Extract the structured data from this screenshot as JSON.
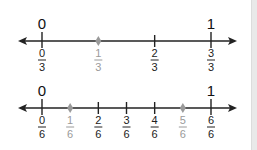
{
  "number_lines": [
    {
      "name": "thirds",
      "start_label": "0",
      "end_label": "1",
      "denominator": "3",
      "ticks": [
        {
          "num": "0",
          "den": "3",
          "highlight": false
        },
        {
          "num": "1",
          "den": "3",
          "highlight": true
        },
        {
          "num": "2",
          "den": "3",
          "highlight": false
        },
        {
          "num": "3",
          "den": "3",
          "highlight": false
        }
      ]
    },
    {
      "name": "sixths",
      "start_label": "0",
      "end_label": "1",
      "denominator": "6",
      "ticks": [
        {
          "num": "0",
          "den": "6",
          "highlight": false
        },
        {
          "num": "1",
          "den": "6",
          "highlight": true
        },
        {
          "num": "2",
          "den": "6",
          "highlight": false
        },
        {
          "num": "3",
          "den": "6",
          "highlight": false
        },
        {
          "num": "4",
          "den": "6",
          "highlight": false
        },
        {
          "num": "5",
          "den": "6",
          "highlight": true
        },
        {
          "num": "6",
          "den": "6",
          "highlight": false
        }
      ]
    }
  ],
  "colors": {
    "line": "#222222",
    "highlight": "#9a9a9a",
    "sidebar": "#e9e9e9"
  }
}
